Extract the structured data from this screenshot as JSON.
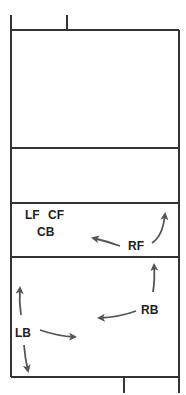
{
  "diagram": {
    "type": "volleyball court rotation diagram",
    "colors": {
      "court_line": "#333333",
      "arrow": "#555555",
      "label": "#222222",
      "background": "#ffffff"
    },
    "positions": {
      "LF": "LF",
      "CF": "CF",
      "CB": "CB",
      "RF": "RF",
      "RB": "RB",
      "LB": "LB"
    },
    "arrows": [
      {
        "from": "RF",
        "direction": "left"
      },
      {
        "from": "RF",
        "direction": "up-right"
      },
      {
        "from": "RB",
        "direction": "up"
      },
      {
        "from": "RB",
        "direction": "left"
      },
      {
        "from": "LB",
        "direction": "up"
      },
      {
        "from": "LB",
        "direction": "right"
      },
      {
        "from": "LB",
        "direction": "down"
      }
    ]
  }
}
